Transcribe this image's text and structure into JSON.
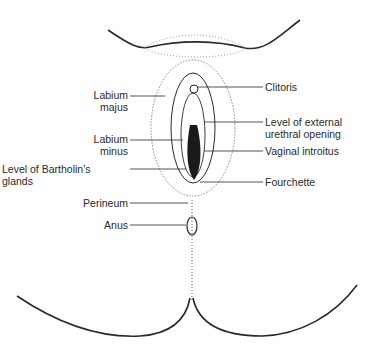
{
  "diagram": {
    "labels": {
      "left": [
        {
          "id": "labium-majus",
          "lines": [
            "Labium",
            "majus"
          ]
        },
        {
          "id": "labium-minus",
          "lines": [
            "Labium",
            "minus"
          ]
        },
        {
          "id": "bartholin",
          "lines": [
            "Level of Bartholin's",
            "glands"
          ]
        },
        {
          "id": "perineum",
          "lines": [
            "Perineum"
          ]
        },
        {
          "id": "anus",
          "lines": [
            "Anus"
          ]
        }
      ],
      "right": [
        {
          "id": "clitoris",
          "lines": [
            "Clitoris"
          ]
        },
        {
          "id": "urethral-opening",
          "lines": [
            "Level of external",
            "urethral opening"
          ]
        },
        {
          "id": "vaginal-introitus",
          "lines": [
            "Vaginal introitus"
          ]
        },
        {
          "id": "fourchette",
          "lines": [
            "Fourchette"
          ]
        }
      ]
    },
    "colors": {
      "line": "#2a2a2a",
      "shade": "#8a8a8a",
      "background": "#ffffff"
    }
  }
}
